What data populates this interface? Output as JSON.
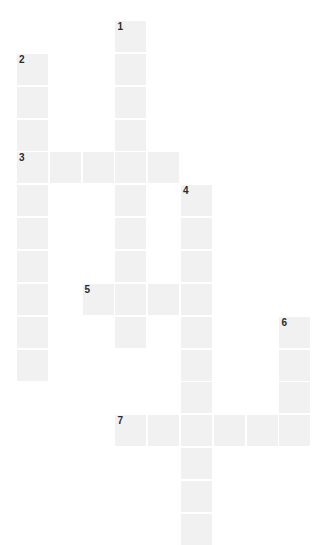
{
  "puzzle": {
    "type": "crossword-grid",
    "title": "",
    "grid": {
      "columns": 9,
      "rows": 16,
      "cell_size_px": 31,
      "cell_pitch_x_px": 32.8,
      "cell_pitch_y_px": 32.85,
      "origin_x_px": 17,
      "origin_y_px": 21,
      "cell_fill_color": "#f1f1f1",
      "background_color": "#ffffff",
      "number_color": "#2b2b2b"
    },
    "entries": [
      {
        "number": "1",
        "direction": "down",
        "start_col": 3,
        "start_row": 0,
        "length": 10
      },
      {
        "number": "2",
        "direction": "down",
        "start_col": 0,
        "start_row": 1,
        "length": 10
      },
      {
        "number": "3",
        "direction": "across",
        "start_col": 0,
        "start_row": 4,
        "length": 5
      },
      {
        "number": "4",
        "direction": "down",
        "start_col": 5,
        "start_row": 5,
        "length": 11
      },
      {
        "number": "5",
        "direction": "across",
        "start_col": 2,
        "start_row": 8,
        "length": 4
      },
      {
        "number": "6",
        "direction": "down",
        "start_col": 8,
        "start_row": 9,
        "length": 4
      },
      {
        "number": "7",
        "direction": "across",
        "start_col": 3,
        "start_row": 12,
        "length": 6
      }
    ],
    "cells": [
      {
        "col": 3,
        "row": 0,
        "number": "1",
        "letter": ""
      },
      {
        "col": 3,
        "row": 1,
        "number": "",
        "letter": ""
      },
      {
        "col": 0,
        "row": 1,
        "number": "2",
        "letter": ""
      },
      {
        "col": 0,
        "row": 2,
        "number": "",
        "letter": ""
      },
      {
        "col": 3,
        "row": 2,
        "number": "",
        "letter": ""
      },
      {
        "col": 0,
        "row": 3,
        "number": "",
        "letter": ""
      },
      {
        "col": 3,
        "row": 3,
        "number": "",
        "letter": ""
      },
      {
        "col": 0,
        "row": 4,
        "number": "3",
        "letter": ""
      },
      {
        "col": 1,
        "row": 4,
        "number": "",
        "letter": ""
      },
      {
        "col": 2,
        "row": 4,
        "number": "",
        "letter": ""
      },
      {
        "col": 3,
        "row": 4,
        "number": "",
        "letter": ""
      },
      {
        "col": 4,
        "row": 4,
        "number": "",
        "letter": ""
      },
      {
        "col": 0,
        "row": 5,
        "number": "",
        "letter": ""
      },
      {
        "col": 3,
        "row": 5,
        "number": "",
        "letter": ""
      },
      {
        "col": 5,
        "row": 5,
        "number": "4",
        "letter": ""
      },
      {
        "col": 0,
        "row": 6,
        "number": "",
        "letter": ""
      },
      {
        "col": 3,
        "row": 6,
        "number": "",
        "letter": ""
      },
      {
        "col": 5,
        "row": 6,
        "number": "",
        "letter": ""
      },
      {
        "col": 0,
        "row": 7,
        "number": "",
        "letter": ""
      },
      {
        "col": 3,
        "row": 7,
        "number": "",
        "letter": ""
      },
      {
        "col": 5,
        "row": 7,
        "number": "",
        "letter": ""
      },
      {
        "col": 0,
        "row": 8,
        "number": "",
        "letter": ""
      },
      {
        "col": 2,
        "row": 8,
        "number": "5",
        "letter": ""
      },
      {
        "col": 3,
        "row": 8,
        "number": "",
        "letter": ""
      },
      {
        "col": 4,
        "row": 8,
        "number": "",
        "letter": ""
      },
      {
        "col": 5,
        "row": 8,
        "number": "",
        "letter": ""
      },
      {
        "col": 0,
        "row": 9,
        "number": "",
        "letter": ""
      },
      {
        "col": 3,
        "row": 9,
        "number": "",
        "letter": ""
      },
      {
        "col": 5,
        "row": 9,
        "number": "",
        "letter": ""
      },
      {
        "col": 8,
        "row": 9,
        "number": "6",
        "letter": ""
      },
      {
        "col": 0,
        "row": 10,
        "number": "",
        "letter": ""
      },
      {
        "col": 5,
        "row": 10,
        "number": "",
        "letter": ""
      },
      {
        "col": 8,
        "row": 10,
        "number": "",
        "letter": ""
      },
      {
        "col": 5,
        "row": 11,
        "number": "",
        "letter": ""
      },
      {
        "col": 8,
        "row": 11,
        "number": "",
        "letter": ""
      },
      {
        "col": 3,
        "row": 12,
        "number": "7",
        "letter": ""
      },
      {
        "col": 4,
        "row": 12,
        "number": "",
        "letter": ""
      },
      {
        "col": 5,
        "row": 12,
        "number": "",
        "letter": ""
      },
      {
        "col": 6,
        "row": 12,
        "number": "",
        "letter": ""
      },
      {
        "col": 7,
        "row": 12,
        "number": "",
        "letter": ""
      },
      {
        "col": 8,
        "row": 12,
        "number": "",
        "letter": ""
      },
      {
        "col": 5,
        "row": 13,
        "number": "",
        "letter": ""
      },
      {
        "col": 5,
        "row": 14,
        "number": "",
        "letter": ""
      },
      {
        "col": 5,
        "row": 15,
        "number": "",
        "letter": ""
      }
    ]
  }
}
